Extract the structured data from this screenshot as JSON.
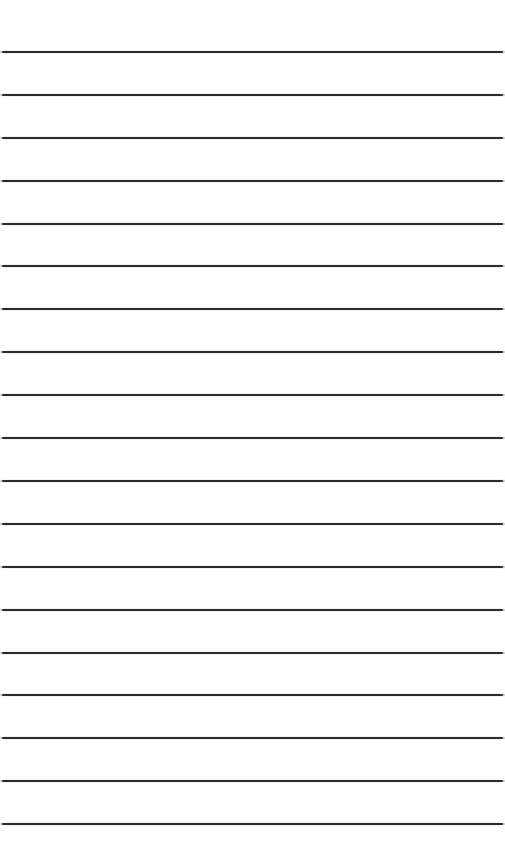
{
  "page": {
    "type": "lined-paper",
    "background_color": "#ffffff",
    "line_color": "#2b2b2b",
    "line_count": 19,
    "first_line_y": 52,
    "line_spacing": 42.9
  },
  "lines": [
    {
      "y": 52
    },
    {
      "y": 95
    },
    {
      "y": 138
    },
    {
      "y": 181
    },
    {
      "y": 224
    },
    {
      "y": 266
    },
    {
      "y": 309
    },
    {
      "y": 352
    },
    {
      "y": 395
    },
    {
      "y": 438
    },
    {
      "y": 481
    },
    {
      "y": 524
    },
    {
      "y": 567
    },
    {
      "y": 610
    },
    {
      "y": 653
    },
    {
      "y": 695
    },
    {
      "y": 738
    },
    {
      "y": 781
    },
    {
      "y": 824
    }
  ]
}
